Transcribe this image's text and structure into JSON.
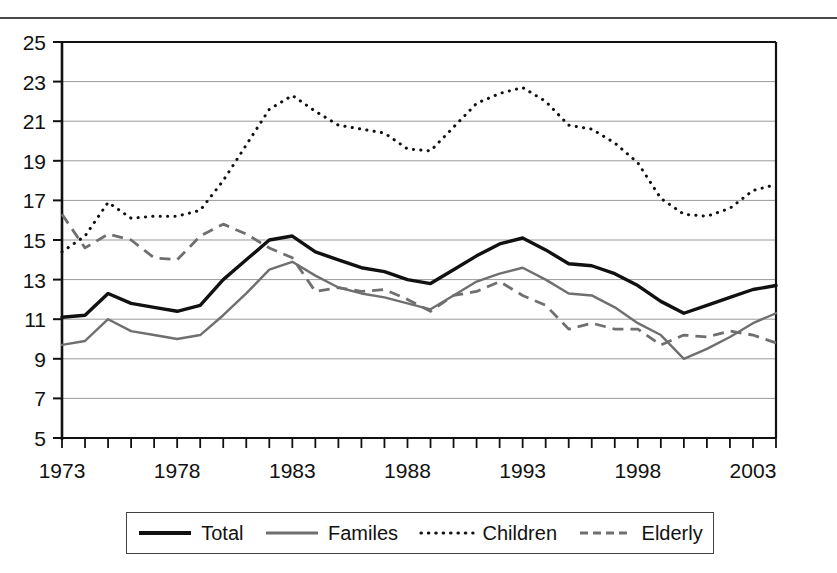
{
  "figure": {
    "clipped_header": "",
    "background": "#ffffff"
  },
  "chart_data": {
    "type": "line",
    "title": "",
    "subtitle": "",
    "xlabel": "",
    "ylabel": "",
    "xlim": [
      1973,
      2004
    ],
    "ylim": [
      5,
      25
    ],
    "ytick_step": 2,
    "yticks": [
      5,
      7,
      9,
      11,
      13,
      15,
      17,
      19,
      21,
      23,
      25
    ],
    "xticks_labeled": [
      1973,
      1978,
      1983,
      1988,
      1993,
      1998,
      2003
    ],
    "xtick_step": 1,
    "grid": true,
    "grid_axis": "y",
    "legend_position": "bottom",
    "x": [
      1973,
      1974,
      1975,
      1976,
      1977,
      1978,
      1979,
      1980,
      1981,
      1982,
      1983,
      1984,
      1985,
      1986,
      1987,
      1988,
      1989,
      1990,
      1991,
      1992,
      1993,
      1994,
      1995,
      1996,
      1997,
      1998,
      1999,
      2000,
      2001,
      2002,
      2003,
      2004
    ],
    "series": [
      {
        "name": "Total",
        "color": "#111111",
        "style": "solid",
        "width": 3.4,
        "values": [
          11.1,
          11.2,
          12.3,
          11.8,
          11.6,
          11.4,
          11.7,
          13.0,
          14.0,
          15.0,
          15.2,
          14.4,
          14.0,
          13.6,
          13.4,
          13.0,
          12.8,
          13.5,
          14.2,
          14.8,
          15.1,
          14.5,
          13.8,
          13.7,
          13.3,
          12.7,
          11.9,
          11.3,
          11.7,
          12.1,
          12.5,
          12.7
        ]
      },
      {
        "name": "Familes",
        "color": "#6f6f6f",
        "style": "solid",
        "width": 2.4,
        "values": [
          9.7,
          9.9,
          11.0,
          10.4,
          10.2,
          10.0,
          10.2,
          11.2,
          12.3,
          13.5,
          13.9,
          13.2,
          12.6,
          12.3,
          12.1,
          11.8,
          11.5,
          12.2,
          12.9,
          13.3,
          13.6,
          13.0,
          12.3,
          12.2,
          11.6,
          10.8,
          10.2,
          9.0,
          9.5,
          10.1,
          10.8,
          11.3
        ]
      },
      {
        "name": "Children",
        "color": "#111111",
        "style": "dotted",
        "width": 3.0,
        "values": [
          14.4,
          15.2,
          16.9,
          16.1,
          16.2,
          16.2,
          16.5,
          18.0,
          19.8,
          21.6,
          22.3,
          21.5,
          20.8,
          20.6,
          20.4,
          19.6,
          19.5,
          20.7,
          21.9,
          22.4,
          22.7,
          22.0,
          20.8,
          20.6,
          19.9,
          18.9,
          17.1,
          16.3,
          16.2,
          16.6,
          17.5,
          17.8
        ]
      },
      {
        "name": "Elderly",
        "color": "#6f6f6f",
        "style": "dashed",
        "width": 2.8,
        "values": [
          16.3,
          14.6,
          15.3,
          15.0,
          14.1,
          14.0,
          15.2,
          15.8,
          15.3,
          14.6,
          14.1,
          12.4,
          12.6,
          12.4,
          12.5,
          12.0,
          11.4,
          12.2,
          12.4,
          12.9,
          12.2,
          11.7,
          10.5,
          10.8,
          10.5,
          10.5,
          9.7,
          10.2,
          10.1,
          10.4,
          10.2,
          9.8
        ]
      }
    ]
  },
  "legend": {
    "items": [
      {
        "label": "Total",
        "style": "solid-thick",
        "color": "#111111"
      },
      {
        "label": "Familes",
        "style": "solid-thin",
        "color": "#6f6f6f"
      },
      {
        "label": "Children",
        "style": "dotted",
        "color": "#111111"
      },
      {
        "label": "Elderly",
        "style": "dashed",
        "color": "#6f6f6f"
      }
    ]
  }
}
